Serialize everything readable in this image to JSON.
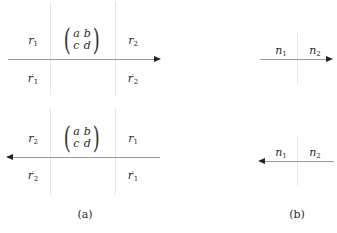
{
  "panels": {
    "a": {
      "caption": "(a)",
      "top": {
        "arrow_direction": "right",
        "labels": {
          "upper_left": {
            "base": "r",
            "sub": "1",
            "prime": ""
          },
          "upper_right": {
            "base": "r",
            "sub": "2",
            "prime": ""
          },
          "lower_left": {
            "base": "r",
            "sub": "1",
            "prime": "′"
          },
          "lower_right": {
            "base": "r",
            "sub": "2",
            "prime": "′"
          }
        },
        "matrix": {
          "a": "a",
          "b": "b",
          "c": "c",
          "d": "d"
        }
      },
      "bottom": {
        "arrow_direction": "left",
        "labels": {
          "upper_left": {
            "base": "r",
            "sub": "2",
            "prime": ""
          },
          "upper_right": {
            "base": "r",
            "sub": "1",
            "prime": ""
          },
          "lower_left": {
            "base": "r",
            "sub": "2",
            "prime": "′"
          },
          "lower_right": {
            "base": "r",
            "sub": "1",
            "prime": "′"
          }
        },
        "matrix": {
          "a": "a",
          "b": "b",
          "c": "c",
          "d": "d"
        }
      }
    },
    "b": {
      "caption": "(b)",
      "top": {
        "arrow_direction": "right",
        "labels": {
          "left": {
            "base": "n",
            "sub": "1"
          },
          "right": {
            "base": "n",
            "sub": "2"
          }
        }
      },
      "bottom": {
        "arrow_direction": "left",
        "labels": {
          "left": {
            "base": "n",
            "sub": "1"
          },
          "right": {
            "base": "n",
            "sub": "2"
          }
        }
      }
    }
  }
}
